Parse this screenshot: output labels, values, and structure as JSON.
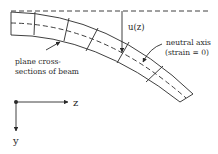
{
  "diagram": {
    "labels": {
      "deflection": "u(z)",
      "neutral_axis_line1": "neutral axis",
      "neutral_axis_line2": "(strain = 0)",
      "cross_sections_line1": "plane cross-",
      "cross_sections_line2": "sections of beam",
      "axis_z": "z",
      "axis_y": "y"
    },
    "colors": {
      "stroke": "#2a2a2a",
      "background": "#ffffff"
    }
  }
}
